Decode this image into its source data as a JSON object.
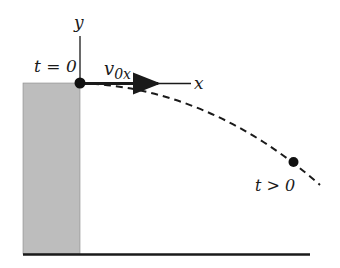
{
  "diagram": {
    "axes": {
      "x_label": "x",
      "y_label": "y"
    },
    "labels": {
      "start_time": "t = 0",
      "later_time": "t > 0",
      "velocity_symbol": "v",
      "velocity_subscript": "0x"
    },
    "colors": {
      "cliff_fill": "#bdbdbd",
      "ink": "#1a1a1a"
    }
  }
}
